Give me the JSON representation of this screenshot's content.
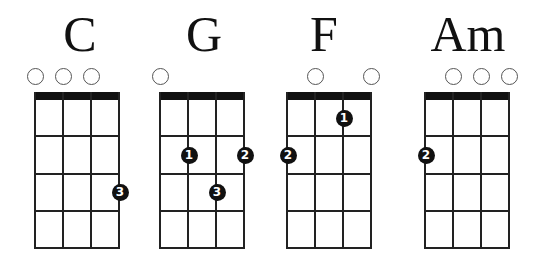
{
  "diagram": {
    "type": "ukulele-chord-chart",
    "strings": 4,
    "frets_shown": 4,
    "chords": [
      {
        "name": "C",
        "open_strings": [
          1,
          2,
          3
        ],
        "fingers": [
          {
            "string": 4,
            "fret": 3,
            "finger": "3"
          }
        ]
      },
      {
        "name": "G",
        "open_strings": [
          1
        ],
        "fingers": [
          {
            "string": 2,
            "fret": 2,
            "finger": "1"
          },
          {
            "string": 4,
            "fret": 2,
            "finger": "2"
          },
          {
            "string": 3,
            "fret": 3,
            "finger": "3"
          }
        ]
      },
      {
        "name": "F",
        "open_strings": [
          2,
          4
        ],
        "fingers": [
          {
            "string": 3,
            "fret": 1,
            "finger": "1"
          },
          {
            "string": 1,
            "fret": 2,
            "finger": "2"
          }
        ]
      },
      {
        "name": "Am",
        "open_strings": [
          2,
          3,
          4
        ],
        "fingers": [
          {
            "string": 1,
            "fret": 2,
            "finger": "2"
          }
        ]
      }
    ]
  },
  "layout": {
    "grid_lefts": [
      35,
      160,
      287,
      425
    ],
    "string_spacing": 28,
    "nut_top": 92,
    "nut_height": 8,
    "fret_lines_y": [
      100,
      135,
      173,
      210,
      247
    ],
    "open_circle_center_y": 76,
    "title_centers_x": [
      80,
      204,
      324,
      468
    ],
    "colors": {
      "ink": "#111111",
      "background": "#ffffff",
      "open_circle_border": "#555555"
    }
  }
}
